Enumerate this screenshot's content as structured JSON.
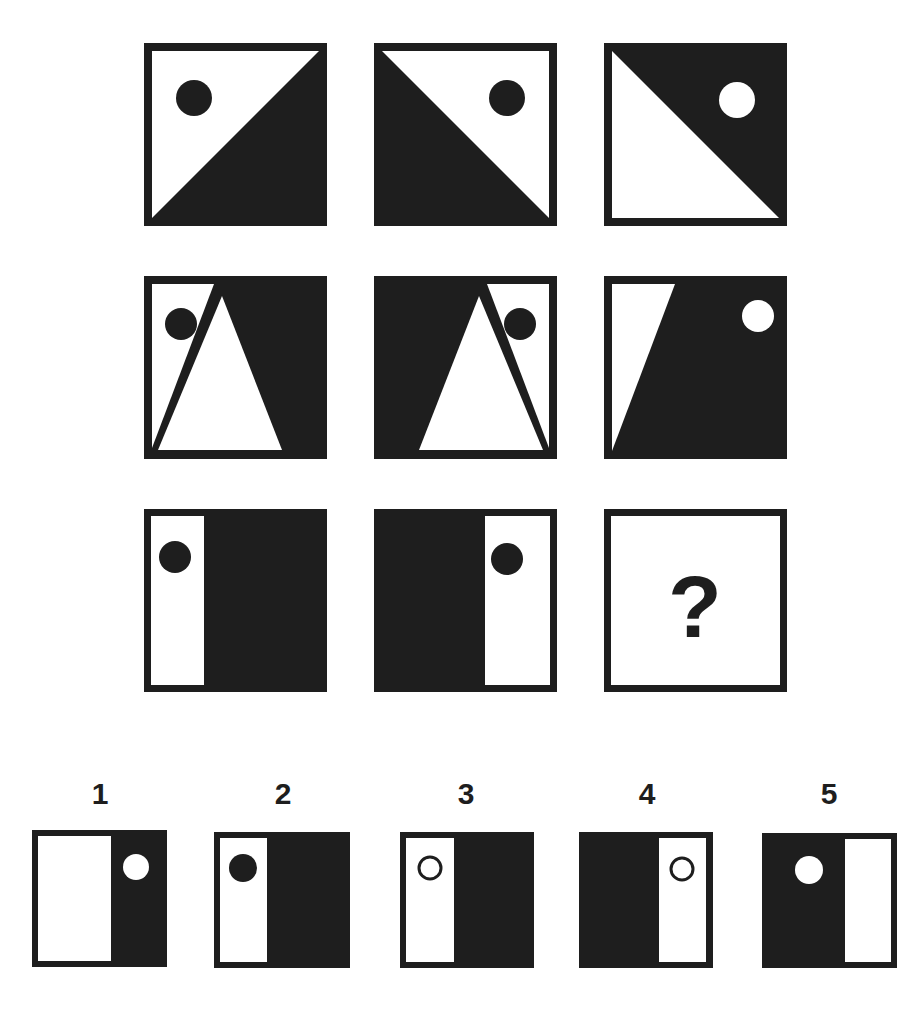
{
  "colors": {
    "ink": "#1e1e1e",
    "paper": "#ffffff"
  },
  "matrix": {
    "rows": [
      [
        {
          "id": "r1c1",
          "description": "white upper-left triangle, black lower-right triangle, black dot upper-left"
        },
        {
          "id": "r1c2",
          "description": "black lower-left triangle, white upper-right triangle, black dot upper-right"
        },
        {
          "id": "r1c3",
          "description": "black upper-right triangle, white lower-left triangle, white dot upper-right"
        }
      ],
      [
        {
          "id": "r2c1",
          "description": "white left strip and white center triangle, black right area, black dot upper-left"
        },
        {
          "id": "r2c2",
          "description": "black left area, white center triangle and white right strip, black dot upper-right"
        },
        {
          "id": "r2c3",
          "description": "white left sliver, black right area, white dot upper-right"
        }
      ],
      [
        {
          "id": "r3c1",
          "description": "white left third, black right, black dot upper-left"
        },
        {
          "id": "r3c2",
          "description": "black left, white right third, black dot upper-right"
        },
        {
          "id": "r3c3",
          "description": "missing cell",
          "symbol": "?"
        }
      ]
    ]
  },
  "answers": [
    {
      "label": "1",
      "description": "white left, black right third, white dot in black area"
    },
    {
      "label": "2",
      "description": "white left third, black right, black dot in white area"
    },
    {
      "label": "3",
      "description": "white left third, black right, hollow ring in white area"
    },
    {
      "label": "4",
      "description": "black left, white right third, hollow ring in white area"
    },
    {
      "label": "5",
      "description": "black left, white right third, white dot in black area"
    }
  ]
}
